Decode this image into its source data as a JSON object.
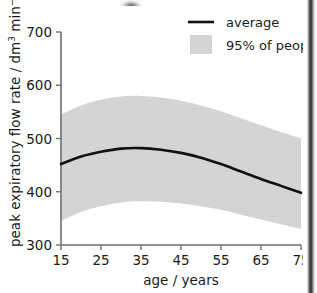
{
  "chart_data": {
    "type": "line",
    "title": "",
    "xlabel": "age / years",
    "ylabel": "peak expiratory flow rate / dm3 min-1",
    "ylabel_parts": {
      "prefix": "peak expiratory flow rate / dm",
      "sup1": "3",
      "mid": " min",
      "sup2": "−1"
    },
    "xlim": [
      15,
      75
    ],
    "ylim": [
      300,
      700
    ],
    "xticks": [
      15,
      25,
      35,
      45,
      55,
      65,
      75
    ],
    "yticks": [
      300,
      400,
      500,
      600,
      700
    ],
    "grid": false,
    "legend_position": "top-right",
    "x": [
      15,
      20,
      25,
      30,
      35,
      40,
      45,
      50,
      55,
      60,
      65,
      70,
      75
    ],
    "series": [
      {
        "name": "average",
        "type": "line",
        "color": "#111111",
        "values": [
          452,
          466,
          475,
          481,
          482,
          479,
          473,
          464,
          452,
          438,
          424,
          411,
          398
        ]
      },
      {
        "name": "95% of people",
        "type": "band",
        "color": "#d4d4d4",
        "upper": [
          545,
          562,
          573,
          579,
          580,
          577,
          571,
          562,
          551,
          538,
          525,
          512,
          500
        ],
        "lower": [
          345,
          362,
          373,
          380,
          382,
          381,
          378,
          373,
          366,
          357,
          348,
          339,
          330
        ]
      }
    ],
    "legend": [
      {
        "label": "average",
        "marker": "line",
        "color": "#111111"
      },
      {
        "label": "95% of people",
        "marker": "swatch",
        "color": "#d4d4d4"
      }
    ]
  },
  "axes": {
    "x_tick_labels": [
      "15",
      "25",
      "35",
      "45",
      "55",
      "65",
      "75"
    ],
    "y_tick_labels": [
      "300",
      "400",
      "500",
      "600",
      "700"
    ],
    "x_title": "age / years",
    "y_title_prefix": "peak expiratory flow rate / dm",
    "y_title_sup1": "3",
    "y_title_mid": " min",
    "y_title_sup2": "−1"
  },
  "legend": {
    "average_label": "average",
    "band_label": "95% of people"
  },
  "colors": {
    "band": "#d4d4d4",
    "curve": "#111111",
    "axis": "#6e6e6e",
    "text": "#1a1a1a",
    "background": "#ffffff"
  }
}
